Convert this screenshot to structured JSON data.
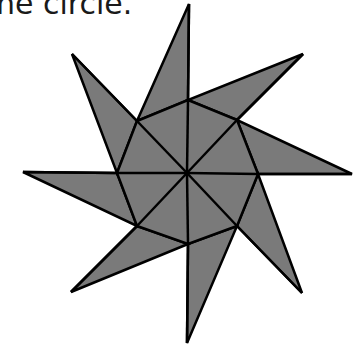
{
  "caption": "ne circle.",
  "figure": {
    "name": "eight-pointed-star",
    "fill": "#7a7a7a",
    "stroke": "#000000",
    "center": [
      187,
      173
    ],
    "tips": [
      [
        189,
        4
      ],
      [
        303,
        54
      ],
      [
        352,
        174
      ],
      [
        302,
        293
      ],
      [
        187,
        343
      ],
      [
        71,
        292
      ],
      [
        23,
        172
      ],
      [
        72,
        54
      ]
    ],
    "inner": [
      [
        188,
        100
      ],
      [
        237,
        120
      ],
      [
        258,
        174
      ],
      [
        237,
        226
      ],
      [
        188,
        244
      ],
      [
        137,
        226
      ],
      [
        117,
        173
      ],
      [
        137,
        121
      ]
    ]
  }
}
